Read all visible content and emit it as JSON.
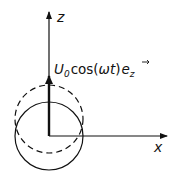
{
  "diagram": {
    "axes": {
      "z_label": "z",
      "x_label": "x"
    },
    "velocity_label": {
      "U": "U",
      "U_sub": "0",
      "cos": "cos(",
      "omega_t": "ωt",
      "close": ")",
      "e": "e",
      "e_sub": "z"
    },
    "shapes": {
      "solid_circle": {
        "cx": 49,
        "cy": 136,
        "r": 34,
        "style": "solid"
      },
      "dashed_circle": {
        "cx": 49,
        "cy": 119,
        "r": 34,
        "style": "dashed"
      }
    },
    "colors": {
      "stroke": "#111111",
      "background": "#ffffff"
    }
  }
}
